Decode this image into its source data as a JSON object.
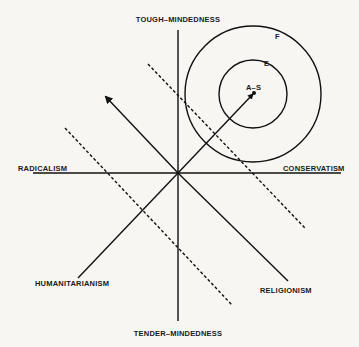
{
  "diagram": {
    "axes": {
      "top": "TOUGH–MINDEDNESS",
      "bottom": "TENDER–MINDEDNESS",
      "left": "RADICALISM",
      "right": "CONSERVATISM",
      "lower_left": "HUMANITARIANISM",
      "lower_right": "RELIGIONISM"
    },
    "circles": {
      "outer": "F",
      "inner": "E",
      "center_point": "A–S"
    },
    "colors": {
      "ink": "#111111",
      "paper": "#f7f6f3"
    }
  }
}
